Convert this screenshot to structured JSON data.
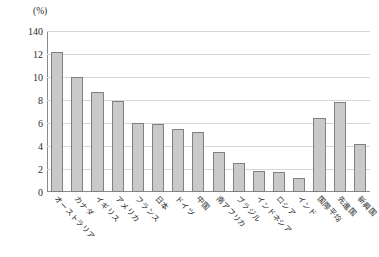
{
  "chart_data": {
    "type": "bar",
    "title": "",
    "subtitle": "",
    "unit_label": "(%)",
    "xlabel": "",
    "ylabel": "",
    "ylim": [
      0,
      14
    ],
    "grid": true,
    "legend": "none",
    "ytick_labels": [
      "140",
      "12",
      "10",
      "8",
      "6",
      "4",
      "2",
      "0"
    ],
    "ytick_values": [
      14,
      12,
      10,
      8,
      6,
      4,
      2,
      0
    ],
    "categories": [
      "オーストラリア",
      "カナダ",
      "イギリス",
      "アメリカ",
      "フランス",
      "日本",
      "ドイツ",
      "中国",
      "南アフリカ",
      "ブラジル",
      "インドネシア",
      "ロシア",
      "インド",
      "国際平均",
      "先進国",
      "新興国"
    ],
    "values": [
      12.2,
      10.0,
      8.7,
      7.9,
      6.0,
      5.9,
      5.5,
      5.2,
      3.5,
      2.5,
      1.8,
      1.7,
      1.2,
      6.4,
      7.8,
      4.2
    ],
    "bar_fill_color": "#c9c9c9",
    "bar_border_color": "#808080",
    "gridline_color": "#d6d6d6",
    "axis_color": "#8a8a8a",
    "background_color": "#ffffff"
  }
}
